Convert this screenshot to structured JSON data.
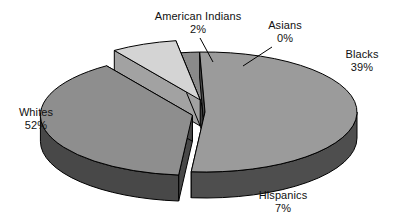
{
  "chart_data": {
    "type": "pie",
    "title": "",
    "subtitle": "",
    "xlabel": "",
    "ylabel": "",
    "legend_position": "none",
    "grid": false,
    "style": "3d-exploded-pie-grayscale",
    "units": "percent",
    "categories": [
      "Whites",
      "Blacks",
      "Hispanics",
      "American Indians",
      "Asians"
    ],
    "values": [
      52,
      39,
      7,
      2,
      0
    ],
    "labels": [
      "52%",
      "39%",
      "7%",
      "2%",
      "0%"
    ],
    "slices": [
      {
        "name": "Whites",
        "value": 52,
        "value_label": "52%",
        "fill_top": "#9b9b9b",
        "fill_wall": "#4e4e4e",
        "exploded": false,
        "label_x": 36,
        "label_y": 116,
        "label_value_y": 129,
        "leader": false
      },
      {
        "name": "Blacks",
        "value": 39,
        "value_label": "39%",
        "fill_top": "#8e8e8e",
        "fill_wall": "#484848",
        "exploded": true,
        "label_x": 362,
        "label_y": 58,
        "label_value_y": 71,
        "leader": false
      },
      {
        "name": "Hispanics",
        "value": 7,
        "value_label": "7%",
        "fill_top": "#d4d4d4",
        "fill_wall": "#a2a2a2",
        "exploded": true,
        "label_x": 283,
        "label_y": 199,
        "label_value_y": 212,
        "leader": false
      },
      {
        "name": "American Indians",
        "value": 2,
        "value_label": "2%",
        "fill_top": "#8a8a8a",
        "fill_wall": "#3f3f3f",
        "exploded": false,
        "label_x": 198,
        "label_y": 20,
        "label_value_y": 33,
        "leader": true,
        "leader_path": "M 200 38 L 213 62"
      },
      {
        "name": "Asians",
        "value": 0,
        "value_label": "0%",
        "fill_top": "#9b9b9b",
        "fill_wall": "#4e4e4e",
        "exploded": false,
        "label_x": 285,
        "label_y": 29,
        "label_value_y": 42,
        "leader": true,
        "leader_path": "M 272 47 L 243 66"
      }
    ],
    "colors": {
      "background": "#ffffff",
      "outline": "#000000",
      "text": "#111111",
      "top_default": "#9b9b9b",
      "wall_default": "#4e4e4e",
      "top_light": "#d4d4d4",
      "wall_light": "#a2a2a2"
    },
    "geometry": {
      "center_x": 205,
      "center_y": 112,
      "radius_x": 152,
      "radius_y": 60,
      "depth": 26,
      "start_angle_deg": 268,
      "direction": "clockwise",
      "explode_offset": 13
    }
  }
}
